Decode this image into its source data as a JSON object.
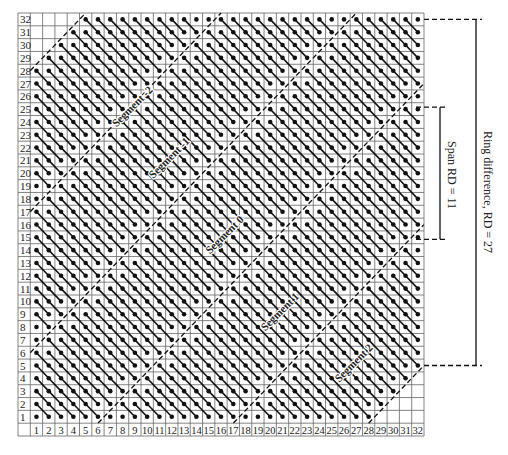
{
  "diagram": {
    "type": "michelogram",
    "grid_size": 32,
    "max_ring_difference": 27,
    "span": 11,
    "row_labels": [
      "1",
      "2",
      "3",
      "4",
      "5",
      "6",
      "7",
      "8",
      "9",
      "10",
      "11",
      "12",
      "13",
      "14",
      "15",
      "16",
      "17",
      "18",
      "19",
      "20",
      "21",
      "22",
      "23",
      "24",
      "25",
      "26",
      "27",
      "28",
      "29",
      "30",
      "31",
      "32"
    ],
    "col_labels": [
      "1",
      "2",
      "3",
      "4",
      "5",
      "6",
      "7",
      "8",
      "9",
      "10",
      "11",
      "12",
      "13",
      "14",
      "15",
      "16",
      "17",
      "18",
      "19",
      "20",
      "21",
      "22",
      "23",
      "24",
      "25",
      "26",
      "27",
      "28",
      "29",
      "30",
      "31",
      "32"
    ],
    "segments": [
      {
        "label": "Segment -2",
        "center_rd": 22
      },
      {
        "label": "Segment -1",
        "center_rd": 11
      },
      {
        "label": "Segment 0",
        "center_rd": 0
      },
      {
        "label": "Segment 1",
        "center_rd": -11
      },
      {
        "label": "Segment 2",
        "center_rd": -22
      }
    ],
    "annotations": {
      "span_label": "Span RD = 11",
      "ring_label": "Ring difference, RD = 27"
    },
    "colors": {
      "line": "#111111",
      "grid": "#555555",
      "background": "#ffffff"
    }
  }
}
